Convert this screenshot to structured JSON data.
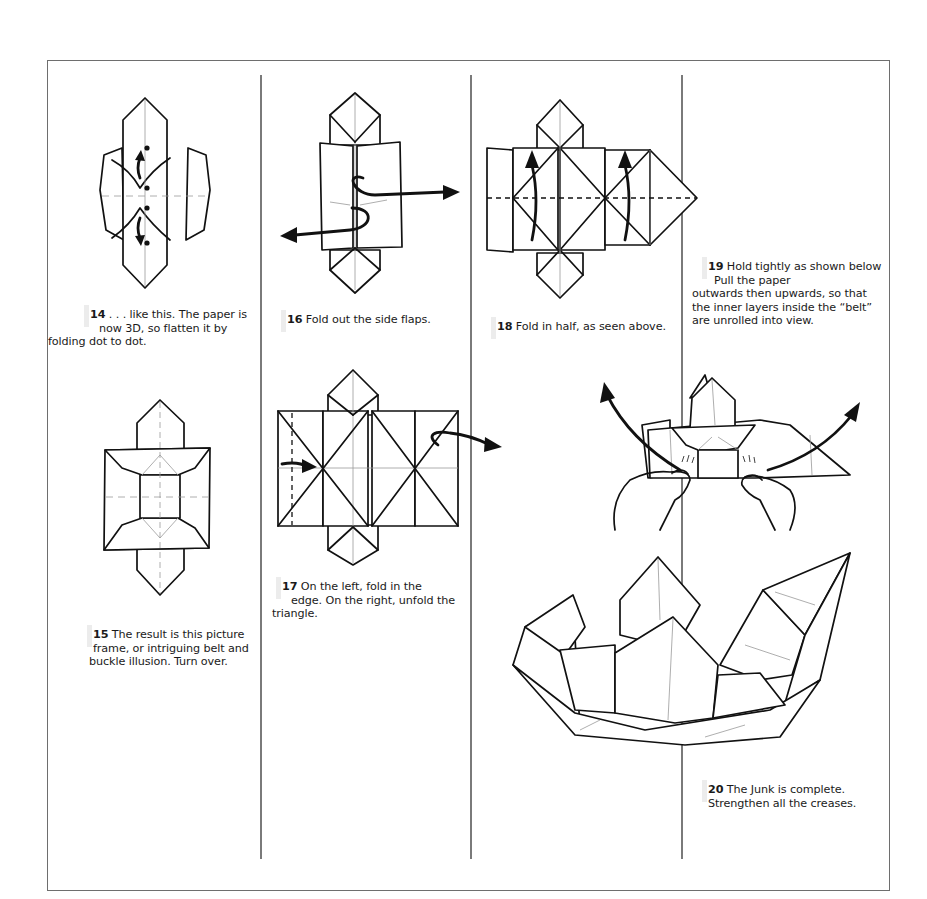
{
  "steps": [
    {
      "number": "14",
      "text_line1": " . . . like this. The paper is",
      "text_line2": "now 3D, so flatten it by",
      "text_line3": "folding dot to dot.",
      "diagram": "partially-flattened-belt-with-dots"
    },
    {
      "number": "15",
      "text_line1": " The result is this picture",
      "text_line2": "frame, or intriguing belt and",
      "text_line3": "buckle illusion. Turn over.",
      "diagram": "picture-frame-belt-buckle"
    },
    {
      "number": "16",
      "text_line1": " Fold out the side flaps.",
      "diagram": "fold-out-side-flaps"
    },
    {
      "number": "17",
      "text_line1": " On the left, fold in the",
      "text_line2": "edge. On the right, unfold the",
      "text_line3": "triangle.",
      "diagram": "fold-edge-unfold-triangle"
    },
    {
      "number": "18",
      "text_line1": " Fold in half, as seen above.",
      "diagram": "fold-in-half"
    },
    {
      "number": "19",
      "text_line1": " Hold tightly as shown below",
      "text_line2": "Pull the paper",
      "text_line3": "outwards then upwards, so that",
      "text_line4": "the inner layers inside the “belt”",
      "text_line5": "are unrolled into view.",
      "diagram": "hands-pulling-belt"
    },
    {
      "number": "20",
      "text_line1": " The Junk is complete.",
      "text_line2": "Strengthen all the creases.",
      "diagram": "completed-junk-boat"
    }
  ],
  "colors": {
    "frame": "#6e6e6e",
    "divider": "#7a7a7a",
    "ink": "#111111",
    "crease": "#999999",
    "step_marker": "#ececec"
  }
}
